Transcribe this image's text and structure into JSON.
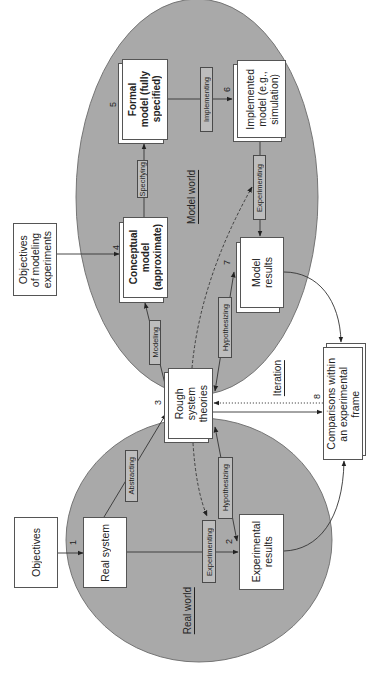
{
  "colors": {
    "region_fill": "#a9a9a9",
    "region_stroke": "#6b6b6b",
    "label_fill": "#bdbdbd",
    "ink": "#222222",
    "box_fill": "#ffffff"
  },
  "regions": {
    "model_world": "Model world",
    "real_world": "Real world"
  },
  "nodes": {
    "objectives_modeling": {
      "lines": [
        "Objectives",
        "of modeling",
        "experiments"
      ]
    },
    "conceptual_model": {
      "lines": [
        "Conceptual",
        "model",
        "(approximate)"
      ],
      "number": "4"
    },
    "formal_model": {
      "lines": [
        "Formal",
        "model (fully",
        "specified)"
      ],
      "number": "5"
    },
    "implemented_model": {
      "lines": [
        "Implemented",
        "model (e.g.,",
        "simulation)"
      ],
      "number": "6"
    },
    "model_results": {
      "lines": [
        "Model",
        "results"
      ],
      "number": "7"
    },
    "rough_theories": {
      "lines": [
        "Rough",
        "system",
        "theories"
      ],
      "number": "3"
    },
    "comparisons": {
      "lines": [
        "Comparisons within",
        "an experimental",
        "frame"
      ],
      "number": "8"
    },
    "objectives": {
      "lines": [
        "Objectives"
      ]
    },
    "real_system": {
      "lines": [
        "Real system"
      ],
      "number": "1"
    },
    "experimental_results": {
      "lines": [
        "Experimental",
        "results"
      ],
      "number": "2"
    }
  },
  "edges": {
    "specifying": "Specifying",
    "modeling": "Modeling",
    "implementing": "Implementing",
    "experimenting_model": "Experimenting",
    "hypothesizing_model": "Hypothesizing",
    "abstracting": "Abstracting",
    "experimenting_real": "Experimenting",
    "hypothesizing_real": "Hypothesizing",
    "iteration": "Iteration"
  },
  "connections": [
    {
      "from": "objectives_modeling",
      "to": "conceptual_model",
      "label": "",
      "style": "solid"
    },
    {
      "from": "conceptual_model",
      "to": "formal_model",
      "label": "Specifying",
      "style": "solid"
    },
    {
      "from": "formal_model",
      "to": "implemented_model",
      "label": "Implementing",
      "style": "solid"
    },
    {
      "from": "implemented_model",
      "to": "model_results",
      "label": "Experimenting",
      "style": "solid"
    },
    {
      "from": "rough_theories",
      "to": "conceptual_model",
      "label": "Modeling",
      "style": "solid"
    },
    {
      "from": "model_results",
      "to": "rough_theories",
      "label": "Hypothesizing",
      "style": "solid-double"
    },
    {
      "from": "objectives",
      "to": "real_system",
      "label": "",
      "style": "solid"
    },
    {
      "from": "real_system",
      "to": "rough_theories",
      "label": "Abstracting",
      "style": "solid"
    },
    {
      "from": "real_system",
      "to": "experimental_results",
      "label": "Experimenting",
      "style": "solid"
    },
    {
      "from": "experimental_results",
      "to": "rough_theories",
      "label": "Hypothesizing",
      "style": "solid-double"
    },
    {
      "from": "rough_theories",
      "to": "comparisons",
      "label": "",
      "style": "solid"
    },
    {
      "from": "comparisons",
      "to": "rough_theories",
      "label": "Iteration",
      "style": "dotted"
    },
    {
      "from": "model_results",
      "to": "comparisons",
      "label": "",
      "style": "curved"
    },
    {
      "from": "experimental_results",
      "to": "comparisons",
      "label": "",
      "style": "curved"
    },
    {
      "from": "rough_theories",
      "to": "implemented_model",
      "label": "",
      "style": "dashed"
    },
    {
      "from": "rough_theories",
      "to": "real_system_experimenting",
      "label": "",
      "style": "dashed"
    }
  ]
}
